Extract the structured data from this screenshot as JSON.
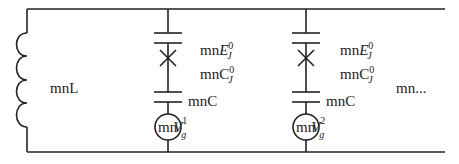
{
  "diagram": {
    "type": "circuit-schematic",
    "inductor": {
      "label": "mnL"
    },
    "branches": [
      {
        "junction_label_prefix": "mn",
        "junction_energy": {
          "base": "E",
          "sub": "J",
          "sup": "0"
        },
        "junction_capacitance": {
          "base": "C",
          "sub": "J",
          "sup": "0"
        },
        "coupling_capacitor": "mnC",
        "source": {
          "prefix": "mn",
          "base": "V",
          "sub": "g",
          "sup": "1"
        }
      },
      {
        "junction_label_prefix": "mn",
        "junction_energy": {
          "base": "E",
          "sub": "J",
          "sup": "0"
        },
        "junction_capacitance": {
          "base": "C",
          "sub": "J",
          "sup": "0"
        },
        "coupling_capacitor": "mnC",
        "source": {
          "prefix": "mn",
          "base": "V",
          "sub": "g",
          "sup": "2"
        }
      }
    ],
    "continuation": "mn..."
  },
  "colors": {
    "line": "#222222",
    "background": "#ffffff"
  }
}
